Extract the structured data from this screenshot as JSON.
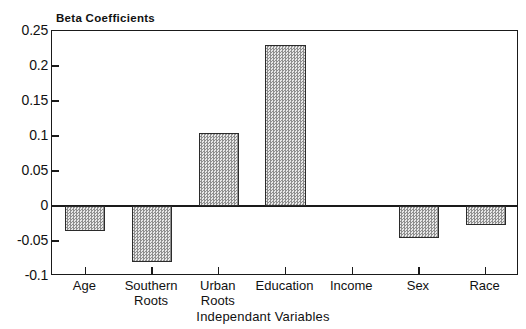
{
  "chart_data": {
    "type": "bar",
    "title": "Beta Coefficients",
    "xlabel": "Independant Variables",
    "ylabel": "",
    "categories": [
      "Age",
      "Southern Roots",
      "Urban Roots",
      "Education",
      "Income",
      "Sex",
      "Race"
    ],
    "values": [
      -0.035,
      -0.08,
      0.104,
      0.23,
      0.0,
      -0.046,
      -0.027
    ],
    "ylim": [
      -0.1,
      0.25
    ],
    "yticks": [
      0.25,
      0.2,
      0.15,
      0.1,
      0.05,
      0,
      -0.05,
      -0.1
    ],
    "ytick_labels": [
      "0.25",
      "0.2",
      "0.15",
      "0.1",
      "0.05",
      "0",
      "-0.05",
      "-0.1"
    ],
    "grid": false,
    "legend": null,
    "bar_fill": "#b9b9b9",
    "bar_edge": "#2b2b2b",
    "axis_color": "#1a1a1a",
    "background": "#ffffff"
  },
  "axis": {
    "title_label": "Beta Coefficients",
    "x_title": "Independant Variables"
  },
  "categories_display": [
    "Age",
    "Southern\nRoots",
    "Urban\nRoots",
    "Education",
    "Income",
    "Sex",
    "Race"
  ]
}
